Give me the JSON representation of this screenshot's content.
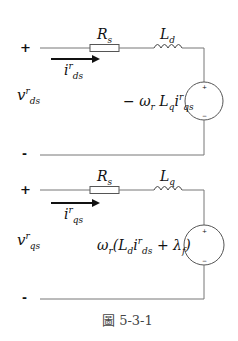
{
  "figure": {
    "caption": "圖 5-3-1",
    "circuits": [
      {
        "id": "d-axis",
        "terminal_plus": "+",
        "terminal_minus": "-",
        "voltage": {
          "base": "v",
          "sup": "r",
          "sub": "ds"
        },
        "current": {
          "base": "i",
          "sup": "r",
          "sub": "ds"
        },
        "resistor": {
          "base": "R",
          "sub": "s"
        },
        "inductor": {
          "base": "L",
          "sub": "d"
        },
        "source": {
          "label_pre": "− ω",
          "label_sub1": "r",
          "label_mid": " L",
          "label_sub2": "q",
          "label_i": "i",
          "label_sup3": "r",
          "label_sub3": "qs",
          "plus": "+",
          "minus": "−"
        }
      },
      {
        "id": "q-axis",
        "terminal_plus": "+",
        "terminal_minus": "-",
        "voltage": {
          "base": "v",
          "sup": "r",
          "sub": "qs"
        },
        "current": {
          "base": "i",
          "sup": "r",
          "sub": "qs"
        },
        "resistor": {
          "base": "R",
          "sub": "s"
        },
        "inductor": {
          "base": "L",
          "sub": "q"
        },
        "source": {
          "label_pre": "ω",
          "label_sub1": "r",
          "label_mid": "(L",
          "label_sub2": "d",
          "label_i": "i",
          "label_sup3": "r",
          "label_sub3": "ds",
          "label_post": " + λ",
          "label_sub4": "f",
          "label_end": ")",
          "plus": "+",
          "minus": "−"
        }
      }
    ]
  }
}
